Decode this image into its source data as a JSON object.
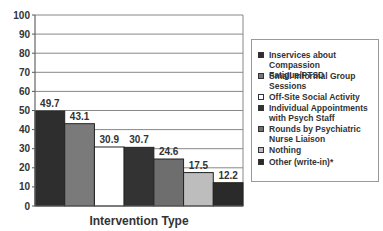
{
  "chart_data": {
    "type": "bar",
    "title": "",
    "xlabel": "Intervention Type",
    "ylabel": "",
    "ylim": [
      0,
      100
    ],
    "yticks": [
      0,
      10,
      20,
      30,
      40,
      50,
      60,
      70,
      80,
      90,
      100
    ],
    "grid": true,
    "legend_position": "right",
    "categories": [
      "Inservices about Compassion Fatigue/PTSD",
      "Small Informal Group Sessions",
      "Off-Site Social Activity",
      "Individual Appointments with Psych Staff",
      "Rounds by Psychiatric Nurse Liaison",
      "Nothing",
      "Other (write-in)*"
    ],
    "values": [
      49.7,
      43.1,
      30.9,
      30.7,
      24.6,
      17.5,
      12.2
    ],
    "colors": [
      "#2e2e2e",
      "#7a7a7a",
      "#ffffff",
      "#333333",
      "#6e6e6e",
      "#bdbdbd",
      "#2a2a2a"
    ]
  },
  "legend": {
    "items": [
      {
        "label": "Inservices    about\nCompassion Fatigue/PTSD",
        "color": "#2e2e2e"
      },
      {
        "label": "Small Informal Group\nSessions",
        "color": "#7a7a7a"
      },
      {
        "label": "Off-Site Social Activity",
        "color": "#ffffff"
      },
      {
        "label": "Individual Appointments\nwith Psych Staff",
        "color": "#333333"
      },
      {
        "label": "Rounds by Psychiatric\nNurse Liaison",
        "color": "#6e6e6e"
      },
      {
        "label": "Nothing",
        "color": "#bdbdbd"
      },
      {
        "label": "Other (write-in)*",
        "color": "#2a2a2a"
      }
    ]
  }
}
